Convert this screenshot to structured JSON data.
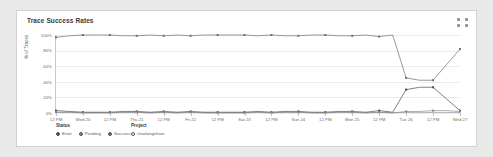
{
  "card": {
    "title": "Trace Success Rates",
    "expand_icon": "expand-icon"
  },
  "legend": {
    "status": {
      "heading": "Status",
      "items": [
        {
          "label": "Error",
          "color": "#4a4a4a",
          "filled": true
        },
        {
          "label": "Pending",
          "color": "#8a8a8a",
          "filled": true
        },
        {
          "label": "Success",
          "color": "#6f6f6f",
          "filled": true
        }
      ]
    },
    "project": {
      "heading": "Project",
      "items": [
        {
          "label": "charlangchain",
          "color": "#ffffff",
          "filled": false
        }
      ]
    }
  },
  "chart_data": {
    "type": "line",
    "title": "Trace Success Rates",
    "xlabel": "",
    "ylabel": "% of Traces",
    "ylim": [
      0,
      100
    ],
    "ytick_labels": [
      "100%",
      "80%",
      "60%",
      "40%",
      "20%",
      "0%"
    ],
    "ytick_values": [
      100,
      80,
      60,
      40,
      20,
      0
    ],
    "grid": true,
    "legend_position": "bottom-left",
    "x": [
      "12 PM",
      "",
      "Wed 20",
      "",
      "12 PM",
      "",
      "Thu 21",
      "",
      "12 PM",
      "",
      "Fri 22",
      "",
      "12 PM",
      "",
      "Sat 23",
      "",
      "12 PM",
      "",
      "Sun 24",
      "",
      "12 PM",
      "",
      "Mon 25",
      "",
      "12 PM",
      "",
      "Tue 26",
      "",
      "12 PM",
      "",
      "Wed 27"
    ],
    "xtick_labels": [
      "12 PM",
      "Wed 20",
      "12 PM",
      "Thu 21",
      "12 PM",
      "Fri 22",
      "12 PM",
      "Sat 23",
      "12 PM",
      "Sun 24",
      "12 PM",
      "Mon 25",
      "12 PM",
      "Tue 26",
      "12 PM",
      "Wed 27"
    ],
    "series": [
      {
        "name": "Success",
        "color": "#6f6f6f",
        "values": [
          97,
          99,
          100,
          100,
          100,
          99,
          99,
          100,
          99,
          100,
          99,
          100,
          100,
          100,
          100,
          99,
          100,
          99,
          99,
          100,
          100,
          99,
          99,
          100,
          98,
          100,
          45,
          42,
          42,
          62,
          82
        ]
      },
      {
        "name": "Error",
        "color": "#4a4a4a",
        "values": [
          3,
          2,
          1,
          1,
          1,
          2,
          2,
          1,
          2,
          1,
          2,
          1,
          1,
          1,
          1,
          2,
          1,
          2,
          2,
          1,
          1,
          2,
          2,
          1,
          3,
          1,
          30,
          33,
          33,
          18,
          3
        ]
      },
      {
        "name": "Pending",
        "color": "#8a8a8a",
        "values": [
          1,
          1,
          0,
          0,
          0,
          1,
          1,
          0,
          1,
          0,
          1,
          0,
          0,
          0,
          0,
          1,
          0,
          1,
          1,
          0,
          0,
          1,
          1,
          0,
          1,
          0,
          2,
          2,
          3,
          3,
          2
        ]
      }
    ]
  }
}
